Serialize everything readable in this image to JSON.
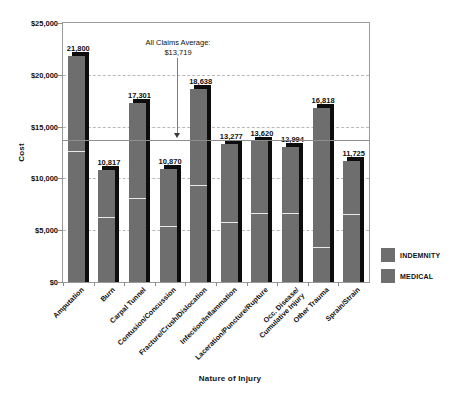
{
  "chart_data": {
    "type": "bar",
    "subtype": "stacked-vertical-with-shadow",
    "title": "",
    "xlabel": "Nature of Injury",
    "ylabel": "Cost",
    "ylim": [
      0,
      25000
    ],
    "ytick_values": [
      0,
      5000,
      10000,
      15000,
      20000,
      25000
    ],
    "ytick_labels": [
      "$0",
      "$5,000",
      "$10,000",
      "$15,000",
      "$20,000",
      "$25,000"
    ],
    "grid": "horizontal-dashed",
    "legend_position": "right",
    "categories": [
      "Amputation",
      "Burn",
      "Carpal Tunnel",
      "Contusion/Concussion",
      "Fracture/Crush/Dislocation",
      "Infection/Inflammation",
      "Laceration/Puncture/Rupture",
      "Occ. Disease/Cumulative Injury",
      "Other Trauma",
      "Sprain/Strain"
    ],
    "category_lines": [
      [
        "Amputation"
      ],
      [
        "Burn"
      ],
      [
        "Carpal Tunnel"
      ],
      [
        "Contusion/Concussion"
      ],
      [
        "Fracture/Crush/Dislocation"
      ],
      [
        "Infection/Inflammation"
      ],
      [
        "Laceration/Puncture/Rupture"
      ],
      [
        "Occ. Disease/",
        "Cumulative Injury"
      ],
      [
        "Other Trauma"
      ],
      [
        "Sprain/Strain"
      ]
    ],
    "totals": [
      21800,
      10817,
      17301,
      10870,
      18638,
      13277,
      13620,
      12994,
      16818,
      11725
    ],
    "total_labels": [
      "21,800",
      "10,817",
      "17,301",
      "10,870",
      "18,638",
      "13,277",
      "13,620",
      "12,994",
      "16,818",
      "11,725"
    ],
    "series": [
      {
        "name": "INDEMNITY",
        "color": "#6e6e6e",
        "values": [
          12600,
          6300,
          8100,
          5400,
          9400,
          5800,
          6700,
          6700,
          3400,
          6600
        ]
      },
      {
        "name": "MEDICAL",
        "color": "#6e6e6e",
        "values": [
          9200,
          4517,
          9201,
          5470,
          9238,
          7477,
          6920,
          6294,
          13418,
          5125
        ]
      }
    ],
    "annotations": [
      {
        "name": "all-claims-average",
        "line1": "All Claims Average:",
        "line2": "$13,719",
        "value": 13719,
        "style": "solid-reference-line-with-down-arrow"
      }
    ]
  },
  "legend": {
    "items": [
      {
        "label": "INDEMNITY",
        "color": "#6e6e6e"
      },
      {
        "label": "MEDICAL",
        "color": "#6e6e6e"
      }
    ]
  }
}
